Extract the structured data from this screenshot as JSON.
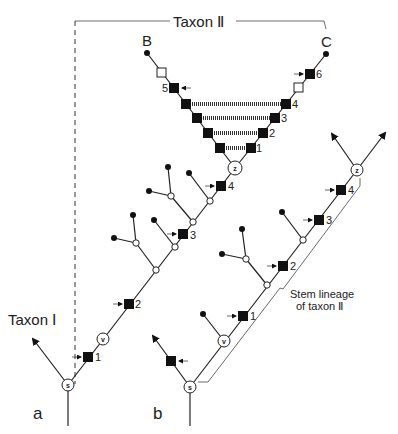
{
  "labels": {
    "taxon_ii": "Taxon Ⅱ",
    "taxon_i": "Taxon Ⅰ",
    "B": "B",
    "C": "C",
    "panel_a": "a",
    "panel_b": "b",
    "stem_line1": "Stem lineage",
    "stem_line2": "of taxon Ⅱ"
  },
  "nodes": {
    "s": "s",
    "v": "v",
    "z": "z"
  },
  "apomorphy_numbers": {
    "a_1": "1",
    "a_2": "2",
    "a_3": "3",
    "a_4": "4",
    "v_left_5": "5",
    "v_right_1": "1",
    "v_right_2": "2",
    "v_right_3": "3",
    "v_right_4": "4",
    "v_right_6": "6",
    "b_1": "1",
    "b_2": "2",
    "b_3": "3",
    "b_4": "4"
  }
}
